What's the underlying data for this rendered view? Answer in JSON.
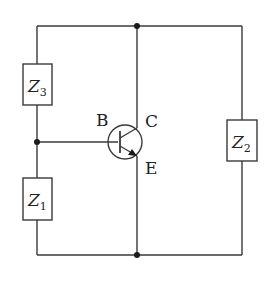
{
  "diagram": {
    "type": "circuit",
    "components": {
      "z3": {
        "symbol": "Z",
        "subscript": "3"
      },
      "z1": {
        "symbol": "Z",
        "subscript": "1"
      },
      "z2": {
        "symbol": "Z",
        "subscript": "2"
      }
    },
    "transistor": {
      "type": "npn-bjt",
      "base_label": "B",
      "collector_label": "C",
      "emitter_label": "E"
    },
    "junctions": [
      "top-middle",
      "left-middle",
      "bottom-middle"
    ],
    "colors": {
      "line": "#3a3a3a",
      "background": "#ffffff"
    }
  }
}
